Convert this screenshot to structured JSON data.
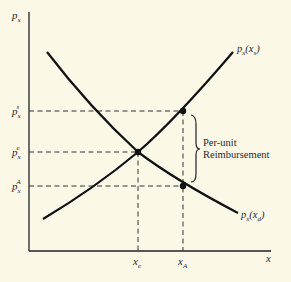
{
  "figure": {
    "y_axis_label": "p",
    "y_axis_sub": "x",
    "x_axis_label": "x",
    "supply_label": {
      "main": "p",
      "sub": "x",
      "arg": "(x",
      "arg_sub": "s",
      "close": ")"
    },
    "demand_label": {
      "main": "p",
      "sub": "x",
      "arg": "(x",
      "arg_sub": "d",
      "close": ")"
    },
    "y_ticks": [
      {
        "main": "p",
        "sub": "x",
        "sup": "s",
        "y": 111
      },
      {
        "main": "p",
        "sub": "x",
        "sup": "e",
        "y": 152
      },
      {
        "main": "p",
        "sub": "x",
        "sup": "A",
        "y": 186
      }
    ],
    "x_ticks": [
      {
        "main": "x",
        "sub": "e",
        "x": 138
      },
      {
        "main": "x",
        "sub": "A",
        "x": 183
      }
    ],
    "brace_label_line1": "Per-unit",
    "brace_label_line2": "Reimbursement",
    "colors": {
      "background": "#fbf8e8",
      "ink": "#1a1a1a"
    }
  }
}
